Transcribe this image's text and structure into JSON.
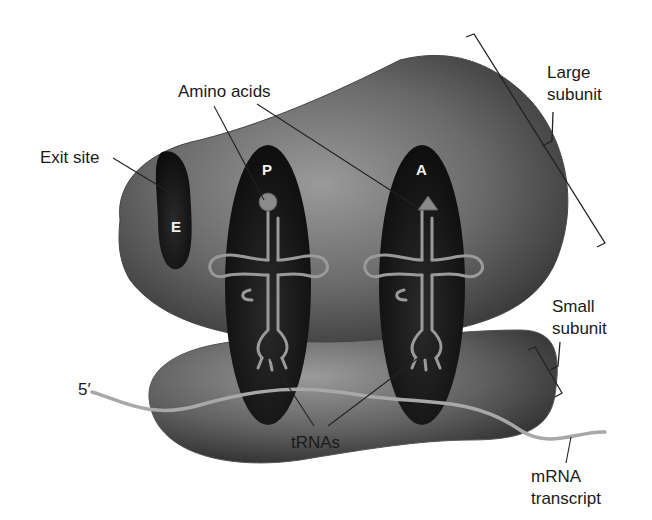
{
  "labels": {
    "amino_acids": "Amino acids",
    "exit_site": "Exit site",
    "large_subunit_line1": "Large",
    "large_subunit_line2": "subunit",
    "small_subunit_line1": "Small",
    "small_subunit_line2": "subunit",
    "five_prime": "5′",
    "trnas": "tRNAs",
    "mrna_line1": "mRNA",
    "mrna_line2": "transcript"
  },
  "sites": {
    "e": "E",
    "p": "P",
    "a": "A"
  },
  "colors": {
    "subunit_dark": "#3a3a3a",
    "subunit_light": "#8a8a8a",
    "pocket": "#151515",
    "trna": "#9a9a9a",
    "mrna": "#a8a8a8",
    "text": "#1a1a1a"
  }
}
